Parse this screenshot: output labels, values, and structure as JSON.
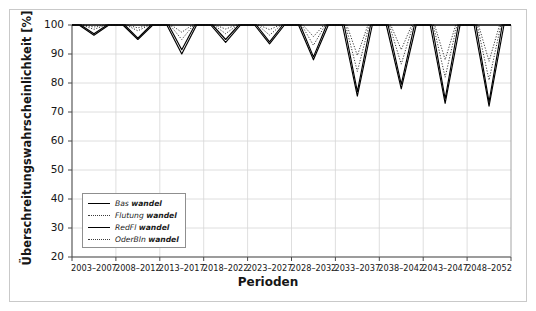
{
  "chart_data": {
    "type": "line",
    "title": "",
    "xlabel": "Perioden",
    "ylabel": "Überschreitungswahrscheinlichkeit [%]",
    "ylim": [
      20,
      100
    ],
    "yticks": [
      20,
      30,
      40,
      50,
      60,
      70,
      80,
      90,
      100
    ],
    "grid": true,
    "legend_position": "lower-left-inside",
    "categories": [
      "2003–2007",
      "2008–2012",
      "2013–2017",
      "2018–2022",
      "2023–2027",
      "2028–2032",
      "2033–2037",
      "2038–2042",
      "2043–2047",
      "2048–2052"
    ],
    "series": [
      {
        "name": "Bas wandel",
        "style": "solid",
        "color": "#000000",
        "values": [
          96.5,
          95.0,
          90.0,
          94.0,
          93.5,
          88.0,
          75.5,
          78.0,
          73.0,
          72.0
        ]
      },
      {
        "name": "Flutung wandel",
        "style": "dotted",
        "color": "#3a3a3a",
        "values": [
          99.3,
          99.0,
          97.5,
          98.6,
          98.4,
          96.0,
          89.5,
          91.5,
          88.0,
          87.5
        ]
      },
      {
        "name": "RedFl wandel",
        "style": "solid",
        "color": "#000000",
        "values": [
          97.0,
          95.5,
          91.5,
          95.0,
          94.2,
          89.0,
          77.0,
          79.5,
          74.5,
          73.5
        ]
      },
      {
        "name": "OderBln wandel",
        "style": "dotted",
        "color": "#3a3a3a",
        "values": [
          98.5,
          98.0,
          95.0,
          97.0,
          96.5,
          93.0,
          84.0,
          86.5,
          82.0,
          81.0
        ]
      }
    ],
    "baseline": 100,
    "note": "Each period shows a V-shaped dip from the 100% baseline down to the series minimum, recovering back to 100% before the next period."
  },
  "legend": {
    "items": [
      {
        "prefix": "Bas ",
        "bold": "wandel",
        "style": "solid"
      },
      {
        "prefix": "Flutung ",
        "bold": "wandel",
        "style": "dotted"
      },
      {
        "prefix": "RedFl ",
        "bold": "wandel",
        "style": "solid"
      },
      {
        "prefix": "OderBln ",
        "bold": "wandel",
        "style": "dotted"
      }
    ]
  }
}
